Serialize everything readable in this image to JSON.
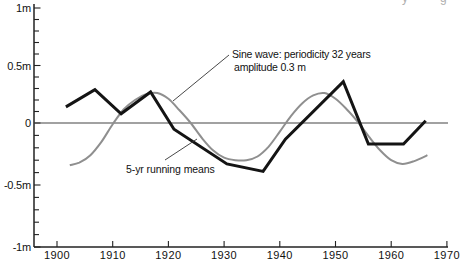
{
  "figure": {
    "background": "#ffffff",
    "cropped_top_fragments": [
      "y",
      "g"
    ]
  },
  "annotations": {
    "sine_label_line1": "Sine wave: periodicity 32 years",
    "sine_label_line2": "amplitude 0.3 m",
    "running_means_label": "5-yr running means"
  },
  "chart_data": {
    "type": "line",
    "title": "",
    "xlabel": "",
    "ylabel": "",
    "grid": false,
    "legend_position": "annotated-inline",
    "x_axis": {
      "ticks": [
        1900,
        1910,
        1920,
        1930,
        1940,
        1950,
        1960,
        1970
      ],
      "range": [
        1895.9,
        1970.2
      ]
    },
    "y_axis": {
      "tick_labels": [
        "1m",
        "0.5m",
        "0",
        "-0.5m",
        "-1m"
      ],
      "tick_values": [
        1,
        0.5,
        0,
        -0.5,
        -1
      ],
      "minor_tick_step": 0.1,
      "range": [
        -1.08,
        1.03
      ]
    },
    "series": [
      {
        "name": "sine-wave",
        "label": "Sine wave: periodicity 32 years, amplitude 0.3 m",
        "style": "smooth",
        "color": "#8f8f8f",
        "stroke_width": 2,
        "points": [
          [
            1902.3,
            -0.34
          ],
          [
            1904,
            -0.32
          ],
          [
            1906,
            -0.26
          ],
          [
            1908,
            -0.15
          ],
          [
            1910,
            -0.01
          ],
          [
            1912,
            0.12
          ],
          [
            1914,
            0.2
          ],
          [
            1916,
            0.25
          ],
          [
            1918,
            0.26
          ],
          [
            1920,
            0.21
          ],
          [
            1922,
            0.11
          ],
          [
            1924,
            0.0
          ],
          [
            1926,
            -0.12
          ],
          [
            1928,
            -0.22
          ],
          [
            1930,
            -0.28
          ],
          [
            1932,
            -0.3
          ],
          [
            1934,
            -0.3
          ],
          [
            1936,
            -0.27
          ],
          [
            1938,
            -0.19
          ],
          [
            1940,
            -0.07
          ],
          [
            1942,
            0.06
          ],
          [
            1944,
            0.17
          ],
          [
            1946,
            0.24
          ],
          [
            1948,
            0.26
          ],
          [
            1950,
            0.21
          ],
          [
            1952,
            0.12
          ],
          [
            1954,
            0.01
          ],
          [
            1956,
            -0.11
          ],
          [
            1958,
            -0.22
          ],
          [
            1960,
            -0.3
          ],
          [
            1962,
            -0.33
          ],
          [
            1964,
            -0.31
          ],
          [
            1966.5,
            -0.26
          ]
        ]
      },
      {
        "name": "running-means",
        "label": "5-yr running means",
        "style": "linear",
        "color": "#141414",
        "stroke_width": 3,
        "points": [
          [
            1901.6,
            0.14
          ],
          [
            1906.8,
            0.29
          ],
          [
            1911.5,
            0.08
          ],
          [
            1916.8,
            0.27
          ],
          [
            1921,
            -0.05
          ],
          [
            1930.5,
            -0.33
          ],
          [
            1937,
            -0.39
          ],
          [
            1941,
            -0.13
          ],
          [
            1951.4,
            0.36
          ],
          [
            1955.9,
            -0.17
          ],
          [
            1962.2,
            -0.17
          ],
          [
            1966.2,
            0.02
          ]
        ]
      }
    ],
    "colors": {
      "axis": "#222222",
      "zero_line": "#444444",
      "leader": "#333333",
      "text": "#111111"
    }
  },
  "layout": {
    "plot": {
      "y_axis_x": 34,
      "axis_top": 4,
      "x_axis_y": 247,
      "axis_right": 448,
      "x_1900": 57,
      "px_per_year": 5.57,
      "zero_y": 123,
      "px_per_m_pos": 115,
      "px_per_m_neg": 124
    },
    "leaders": [
      {
        "name": "sine-wave-leader",
        "from": [
          229,
          55
        ],
        "to": [
          173,
          101
        ]
      },
      {
        "name": "running-means-leader",
        "from": [
          165,
          160
        ],
        "to": [
          197,
          139
        ]
      }
    ],
    "fragment_x": [
      402,
      440
    ]
  }
}
